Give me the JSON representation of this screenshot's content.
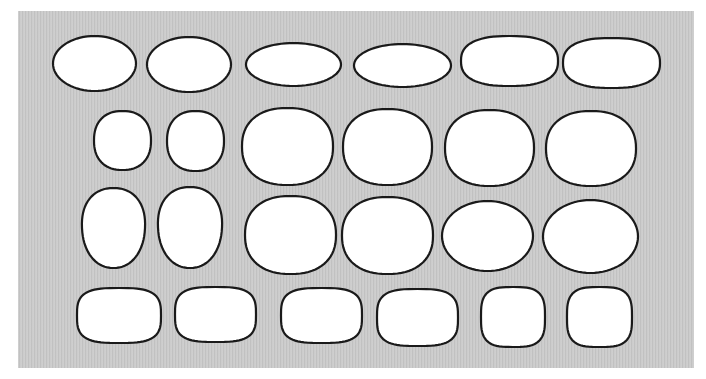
{
  "figure": {
    "background": "#ffffff",
    "panel": {
      "x": 18,
      "y": 11,
      "w": 676,
      "h": 357,
      "color": "#c9c9c9",
      "texture": "fine-vertical-streaks"
    },
    "shape_style": {
      "fill": "#ffffff",
      "stroke": "#1a1a1a",
      "stroke_width": 2
    }
  },
  "rows": [
    {
      "label": "row-1",
      "shapes": [
        {
          "kind": "ellipse",
          "x": 53,
          "y": 36,
          "w": 83,
          "h": 55
        },
        {
          "kind": "ellipse",
          "x": 147,
          "y": 37,
          "w": 84,
          "h": 55
        },
        {
          "kind": "ellipse",
          "x": 246,
          "y": 43,
          "w": 95,
          "h": 43
        },
        {
          "kind": "ellipse",
          "x": 354,
          "y": 44,
          "w": 97,
          "h": 43
        },
        {
          "kind": "rounded-ellipse",
          "x": 461,
          "y": 36,
          "w": 97,
          "h": 50
        },
        {
          "kind": "rounded-ellipse",
          "x": 563,
          "y": 38,
          "w": 97,
          "h": 50
        }
      ]
    },
    {
      "label": "row-2",
      "shapes": [
        {
          "kind": "rounded-circle",
          "x": 94,
          "y": 111,
          "w": 57,
          "h": 59
        },
        {
          "kind": "rounded-circle",
          "x": 167,
          "y": 111,
          "w": 57,
          "h": 60
        },
        {
          "kind": "rounded-circle",
          "x": 242,
          "y": 108,
          "w": 91,
          "h": 77
        },
        {
          "kind": "rounded-circle",
          "x": 343,
          "y": 109,
          "w": 89,
          "h": 76
        },
        {
          "kind": "rounded-circle",
          "x": 445,
          "y": 110,
          "w": 89,
          "h": 76
        },
        {
          "kind": "rounded-circle",
          "x": 546,
          "y": 111,
          "w": 90,
          "h": 75
        }
      ]
    },
    {
      "label": "row-3",
      "shapes": [
        {
          "kind": "egg",
          "x": 82,
          "y": 188,
          "w": 63,
          "h": 80
        },
        {
          "kind": "egg",
          "x": 158,
          "y": 187,
          "w": 64,
          "h": 81
        },
        {
          "kind": "rounded-circle",
          "x": 245,
          "y": 196,
          "w": 91,
          "h": 78
        },
        {
          "kind": "rounded-circle",
          "x": 342,
          "y": 197,
          "w": 91,
          "h": 77
        },
        {
          "kind": "ellipse",
          "x": 442,
          "y": 201,
          "w": 91,
          "h": 70
        },
        {
          "kind": "ellipse",
          "x": 543,
          "y": 200,
          "w": 95,
          "h": 73
        }
      ]
    },
    {
      "label": "row-4",
      "shapes": [
        {
          "kind": "squircle",
          "x": 77,
          "y": 288,
          "w": 84,
          "h": 55
        },
        {
          "kind": "squircle",
          "x": 175,
          "y": 287,
          "w": 81,
          "h": 55
        },
        {
          "kind": "squircle",
          "x": 281,
          "y": 288,
          "w": 81,
          "h": 55
        },
        {
          "kind": "squircle",
          "x": 377,
          "y": 289,
          "w": 81,
          "h": 57
        },
        {
          "kind": "squircle",
          "x": 481,
          "y": 287,
          "w": 64,
          "h": 60
        },
        {
          "kind": "squircle",
          "x": 567,
          "y": 287,
          "w": 65,
          "h": 60
        }
      ]
    }
  ]
}
